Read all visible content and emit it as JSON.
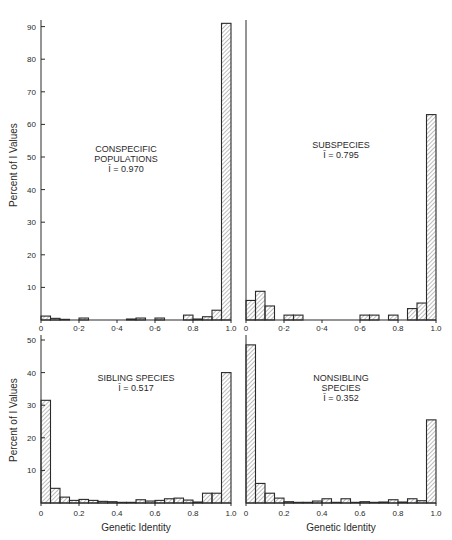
{
  "figure": {
    "ylabel": "Percent of I Values",
    "xlabel": "Genetic Identity",
    "ink_color": "#2a2a2a",
    "hatch_color": "#555555",
    "background": "#ffffff"
  },
  "chart_data": [
    {
      "type": "bar",
      "id": "conspecific",
      "title_lines": [
        "CONSPECIFIC",
        "POPULATIONS",
        "Ī = 0.970"
      ],
      "xlabel": "",
      "ylabel": "Percent of I Values",
      "xticks": [
        "0",
        "0·2",
        "0·4",
        "0·6",
        "0.8",
        "1.0"
      ],
      "yticks": [
        "10",
        "20",
        "30",
        "40",
        "50",
        "60",
        "70",
        "80",
        "90"
      ],
      "ylim": [
        0,
        92
      ],
      "bin_width": 0.05,
      "bins": [
        0,
        0.05,
        0.1,
        0.15,
        0.2,
        0.25,
        0.3,
        0.35,
        0.4,
        0.45,
        0.5,
        0.55,
        0.6,
        0.65,
        0.7,
        0.75,
        0.8,
        0.85,
        0.9,
        0.95
      ],
      "values": [
        1.2,
        0.5,
        0.2,
        0,
        0.6,
        0,
        0,
        0,
        0,
        0.3,
        0.6,
        0,
        0.6,
        0,
        0,
        1.5,
        0.3,
        1.0,
        3.0,
        91.0
      ]
    },
    {
      "type": "bar",
      "id": "subspecies",
      "title_lines": [
        "SUBSPECIES",
        "Ī = 0.795"
      ],
      "xlabel": "",
      "ylabel": "",
      "xticks": [
        "0",
        "0·2",
        "0·4",
        "0·6",
        "0.8",
        "1.0"
      ],
      "yticks": [],
      "ylim": [
        0,
        92
      ],
      "bin_width": 0.05,
      "bins": [
        0,
        0.05,
        0.1,
        0.15,
        0.2,
        0.25,
        0.3,
        0.35,
        0.4,
        0.45,
        0.5,
        0.55,
        0.6,
        0.65,
        0.7,
        0.75,
        0.8,
        0.85,
        0.9,
        0.95
      ],
      "values": [
        6.0,
        8.8,
        4.3,
        0,
        1.5,
        1.5,
        0,
        0,
        0,
        0,
        0,
        0,
        1.5,
        1.5,
        0,
        1.5,
        0,
        3.5,
        5.2,
        63.0
      ]
    },
    {
      "type": "bar",
      "id": "sibling",
      "title_lines": [
        "SIBLING SPECIES",
        "Ī = 0.517"
      ],
      "xlabel": "Genetic Identity",
      "ylabel": "Percent of I Values",
      "xticks": [
        "0",
        "0.2",
        "0.4",
        "0.6",
        "0.8",
        "1.0"
      ],
      "yticks": [
        "10",
        "20",
        "30",
        "40",
        "50"
      ],
      "ylim": [
        0,
        52
      ],
      "bin_width": 0.05,
      "bins": [
        0,
        0.05,
        0.1,
        0.15,
        0.2,
        0.25,
        0.3,
        0.35,
        0.4,
        0.45,
        0.5,
        0.55,
        0.6,
        0.65,
        0.7,
        0.75,
        0.8,
        0.85,
        0.9,
        0.95
      ],
      "values": [
        31.5,
        4.5,
        1.8,
        0.8,
        1.1,
        0.8,
        0.5,
        0.4,
        0.2,
        0.2,
        1.0,
        0.6,
        0.8,
        1.3,
        1.5,
        0.9,
        0.3,
        3.0,
        3.0,
        40.0
      ]
    },
    {
      "type": "bar",
      "id": "nonsibling",
      "title_lines": [
        "NONSIBLING",
        "SPECIES",
        "Ī = 0.352"
      ],
      "xlabel": "Genetic Identity",
      "ylabel": "",
      "xticks": [
        "0",
        "0.2",
        "0.4",
        "0.6",
        "0.8",
        "1.0"
      ],
      "yticks": [],
      "ylim": [
        0,
        52
      ],
      "bin_width": 0.05,
      "bins": [
        0,
        0.05,
        0.1,
        0.15,
        0.2,
        0.25,
        0.3,
        0.35,
        0.4,
        0.45,
        0.5,
        0.55,
        0.6,
        0.65,
        0.7,
        0.75,
        0.8,
        0.85,
        0.9,
        0.95
      ],
      "values": [
        48.5,
        6.0,
        3.0,
        1.5,
        0.4,
        0.2,
        0.2,
        0.6,
        1.3,
        0.2,
        1.3,
        0.2,
        0.4,
        0.2,
        0.3,
        1.0,
        0.3,
        1.3,
        0.7,
        25.5
      ]
    }
  ]
}
